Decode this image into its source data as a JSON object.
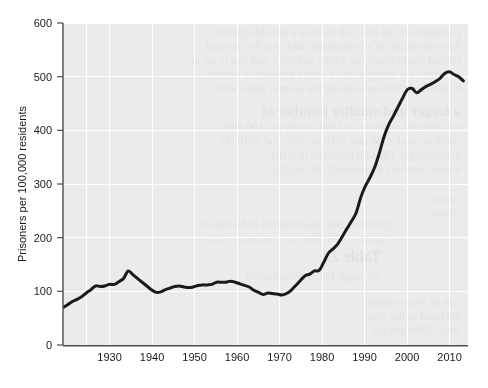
{
  "figure": {
    "background_color": "#ffffff",
    "plot_background_color": "#ebebeb",
    "gridline_color": "#ffffff",
    "axis_color": "#4d4d4d",
    "line_color": "#1a1a1a",
    "has_title": false,
    "title": ""
  },
  "chart_data": {
    "type": "line",
    "title": "",
    "subtitle": "",
    "xlabel": "",
    "ylabel": "Prisoners per 100,000 residents",
    "xlim": [
      1925,
      2012
    ],
    "ylim": [
      0,
      600
    ],
    "xticks": [
      1930,
      1940,
      1950,
      1960,
      1970,
      1980,
      1990,
      2000,
      2010
    ],
    "xtick_labels": [
      "1930",
      "1940",
      "1950",
      "1960",
      "1970",
      "1980",
      "1990",
      "2000",
      "2010"
    ],
    "yticks": [
      0,
      100,
      200,
      300,
      400,
      500,
      600
    ],
    "ytick_labels": [
      "0",
      "100",
      "200",
      "300",
      "400",
      "500",
      "600"
    ],
    "grid": true,
    "grid_axis": "both",
    "legend": false,
    "legend_position": "none",
    "series": [
      {
        "name": "Prisoners per 100,000 residents",
        "color": "#1a1a1a",
        "line_width": 3,
        "x": [
          1925,
          1926,
          1927,
          1928,
          1929,
          1930,
          1931,
          1932,
          1933,
          1934,
          1935,
          1936,
          1937,
          1938,
          1939,
          1940,
          1941,
          1942,
          1943,
          1944,
          1945,
          1946,
          1947,
          1948,
          1949,
          1950,
          1951,
          1952,
          1953,
          1954,
          1955,
          1956,
          1957,
          1958,
          1959,
          1960,
          1961,
          1962,
          1963,
          1964,
          1965,
          1966,
          1967,
          1968,
          1969,
          1970,
          1971,
          1972,
          1973,
          1974,
          1975,
          1976,
          1977,
          1978,
          1979,
          1980,
          1981,
          1982,
          1983,
          1984,
          1985,
          1986,
          1987,
          1988,
          1989,
          1990,
          1991,
          1992,
          1993,
          1994,
          1995,
          1996,
          1997,
          1998,
          1999,
          2000,
          2001,
          2002,
          2003,
          2004,
          2005,
          2006,
          2007,
          2008,
          2009,
          2010,
          2011
        ],
        "y": [
          70,
          75,
          81,
          85,
          90,
          97,
          103,
          110,
          109,
          110,
          113,
          113,
          118,
          124,
          138,
          131,
          124,
          117,
          110,
          103,
          98,
          99,
          103,
          106,
          109,
          110,
          108,
          107,
          108,
          111,
          112,
          112,
          113,
          117,
          117,
          117,
          119,
          117,
          114,
          111,
          108,
          102,
          98,
          94,
          97,
          96,
          95,
          93,
          96,
          102,
          111,
          120,
          129,
          132,
          138,
          139,
          154,
          171,
          179,
          188,
          202,
          217,
          231,
          247,
          276,
          297,
          313,
          332,
          359,
          389,
          411,
          427,
          444,
          461,
          476,
          478,
          470,
          476,
          482,
          486,
          491,
          497,
          506,
          509,
          504,
          500,
          492
        ]
      }
    ],
    "annotations": []
  },
  "axes": {
    "y_axis_title": "Prisoners per 100,000 residents",
    "y_tick_0": "0",
    "y_tick_1": "100",
    "y_tick_2": "200",
    "y_tick_3": "300",
    "y_tick_4": "400",
    "y_tick_5": "500",
    "y_tick_6": "600",
    "x_tick_0": "1930",
    "x_tick_1": "1940",
    "x_tick_2": "1950",
    "x_tick_3": "1960",
    "x_tick_4": "1970",
    "x_tick_5": "1980",
    "x_tick_6": "1990",
    "x_tick_7": "2000",
    "x_tick_8": "2010"
  }
}
